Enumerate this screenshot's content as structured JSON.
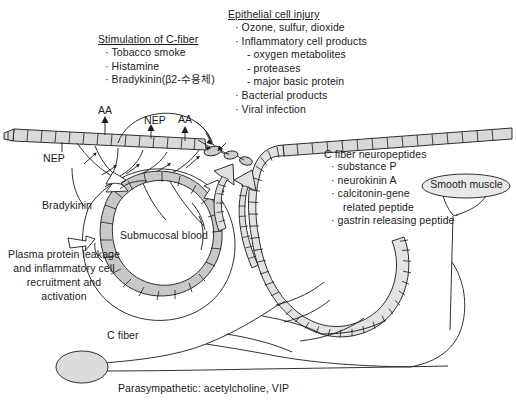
{
  "figure": {
    "background_color": "#ffffff",
    "ink_color": "#1a1a1a",
    "cell_fill_color": "#d6d6d6",
    "vessel_fill_color": "#c8c8c8"
  },
  "blocks": {
    "stimulation": {
      "heading": "Stimulation of C-fiber",
      "items": [
        "· Tobacco smoke",
        "· Histamine",
        "· Bradykinin(β2-수용체)"
      ]
    },
    "epithelial": {
      "heading": "Epithelial cell injury",
      "items": [
        {
          "level": 1,
          "text": "· Ozone, sulfur, dioxide"
        },
        {
          "level": 1,
          "text": "· Inflammatory cell products"
        },
        {
          "level": 2,
          "text": "- oxygen metabolites"
        },
        {
          "level": 2,
          "text": "- proteases"
        },
        {
          "level": 2,
          "text": "- major basic protein"
        },
        {
          "level": 1,
          "text": "· Bacterial products"
        },
        {
          "level": 1,
          "text": "· Viral infection"
        }
      ]
    },
    "neuropeptides": {
      "heading": "C fiber neuropeptides",
      "items": [
        {
          "level": 1,
          "text": "· substance P"
        },
        {
          "level": 1,
          "text": "· neurokinin A"
        },
        {
          "level": 1,
          "text": "· calcitonin-gene"
        },
        {
          "level": 2,
          "text": "related peptide"
        },
        {
          "level": 1,
          "text": "· gastrin releasing peptide"
        }
      ]
    }
  },
  "labels": {
    "bradykinin": "Bradykinin",
    "plasma_protein": "Plasma protein leakage and inflammatory cell recruitment and activation",
    "submucosal_blood": "Submucosal blood",
    "c_fiber": "C fiber",
    "parasympathetic": "Parasympathetic: acetylcholine, VIP",
    "smooth_muscle": "Smooth muscle",
    "aa_left": "AA",
    "aa_right": "AA",
    "nep_top": "NEP",
    "nep_left": "NEP"
  }
}
